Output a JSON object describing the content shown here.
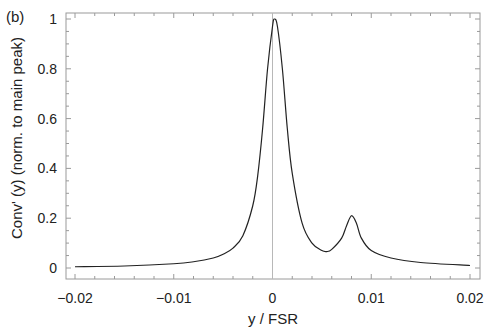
{
  "panel_label": "(b)",
  "chart_data": {
    "type": "line",
    "title": "",
    "xlabel": "y / FSR",
    "ylabel": "Conv' (y)  (norm. to main peak)",
    "xlim": [
      -0.02,
      0.02
    ],
    "ylim": [
      0,
      1
    ],
    "xticks": [
      -0.02,
      -0.01,
      0,
      0.01,
      0.02
    ],
    "xtick_labels": [
      "−0.02",
      "−0.01",
      "0",
      "0.01",
      "0.02"
    ],
    "yticks": [
      0,
      0.2,
      0.4,
      0.6,
      0.8,
      1
    ],
    "ytick_labels": [
      "0",
      "0.2",
      "0.4",
      "0.6",
      "0.8",
      "1"
    ],
    "grid": false,
    "legend": null,
    "vertical_reference_line_x": 0,
    "series": [
      {
        "name": "Conv'(y)",
        "color": "#222222",
        "x": [
          -0.02,
          -0.015,
          -0.01,
          -0.008,
          -0.006,
          -0.005,
          -0.004,
          -0.003,
          -0.002,
          -0.0015,
          -0.001,
          -0.0005,
          0.0,
          0.0002,
          0.0005,
          0.001,
          0.0015,
          0.002,
          0.003,
          0.004,
          0.005,
          0.0055,
          0.006,
          0.007,
          0.0075,
          0.008,
          0.0085,
          0.009,
          0.01,
          0.012,
          0.015,
          0.02
        ],
        "y": [
          0.005,
          0.008,
          0.017,
          0.025,
          0.04,
          0.055,
          0.08,
          0.13,
          0.25,
          0.37,
          0.56,
          0.8,
          0.97,
          1.0,
          0.97,
          0.8,
          0.56,
          0.38,
          0.18,
          0.1,
          0.07,
          0.066,
          0.075,
          0.12,
          0.17,
          0.21,
          0.18,
          0.12,
          0.07,
          0.04,
          0.022,
          0.01
        ]
      }
    ]
  }
}
